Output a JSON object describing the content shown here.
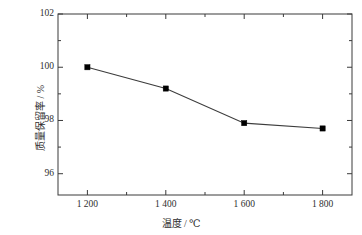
{
  "chart_data": {
    "type": "line",
    "title": "",
    "xlabel": "温度 / ℃",
    "ylabel": "质量保留率 / %",
    "x": [
      1200,
      1400,
      1600,
      1800
    ],
    "values": [
      100.0,
      99.2,
      97.9,
      97.7
    ],
    "series": [
      {
        "name": "质量保留率",
        "values": [
          100.0,
          99.2,
          97.9,
          97.7
        ],
        "marker": "square",
        "marker_color": "#000000",
        "line_color": "#3c3c3c"
      }
    ],
    "xlim": [
      1125,
      1875
    ],
    "ylim": [
      95.2,
      102.0
    ],
    "xticks": [
      1200,
      1400,
      1600,
      1800
    ],
    "xtick_labels": [
      "1 200",
      "1 400",
      "1 600",
      "1 800"
    ],
    "yticks": [
      96,
      98,
      100,
      102
    ],
    "ytick_labels": [
      "96",
      "98",
      "100",
      "102"
    ],
    "minor_ticks": true,
    "grid": false,
    "legend": null,
    "frame": "box",
    "background": "#ffffff"
  }
}
